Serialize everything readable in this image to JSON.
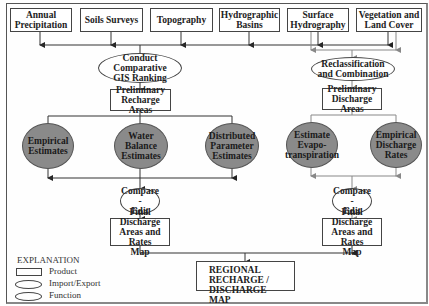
{
  "inputs": [
    {
      "label": "Annual\nPrecipitation"
    },
    {
      "label": "Soils Surveys"
    },
    {
      "label": "Topography"
    },
    {
      "label": "Hydrographic\nBasins"
    },
    {
      "label": "Surface\nHydrography"
    },
    {
      "label": "Vegetation and\nLand Cover"
    }
  ],
  "recharge": {
    "import_process": "Conduct\nComparative\nGIS Ranking",
    "preliminary": "Preliminary\nRecharge Areas",
    "functions": [
      {
        "label": "Empirical\nEstimates"
      },
      {
        "label": "Water Balance\nEstimates"
      },
      {
        "label": "Distributed\nParameter\nEstimates"
      }
    ],
    "compare": "Compare -\nEdit",
    "final": "Final Discharge\nAreas and Rates\nMap"
  },
  "discharge": {
    "import_process": "Reclassification\nand Combination",
    "preliminary": "Preliminary\nDischarge Areas",
    "functions": [
      {
        "label": "Estimate\nEvapo-\ntranspiration"
      },
      {
        "label": "Empirical\nDischarge\nRates"
      }
    ],
    "compare": "Compare -\nEdit",
    "final": "Final Discharge\nAreas and Rates\nMap"
  },
  "output": {
    "label": "REGIONAL\nRECHARGE / DISCHARGE\nMAP"
  },
  "legend": {
    "title": "EXPLANATION",
    "items": [
      {
        "shape": "rectangle",
        "label": "Product"
      },
      {
        "shape": "ellipse-white",
        "label": "Import/Export"
      },
      {
        "shape": "ellipse",
        "label": "Function"
      }
    ]
  },
  "colors": {
    "function_fill": "#8a8a8a",
    "line_dark": "#333333",
    "line_light": "#888888"
  }
}
